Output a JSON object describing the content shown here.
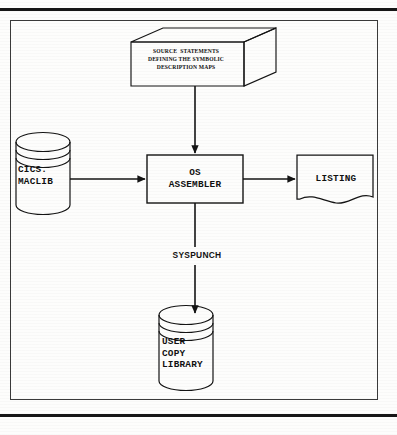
{
  "page": {
    "background_color": "#fdfdfc",
    "ink_color": "#111111",
    "rule_color": "#161616",
    "frame_color": "#3a3a3a"
  },
  "diagram": {
    "type": "flowchart",
    "orientation": "top-down-with-side-inputs-and-outputs",
    "nodes": [
      {
        "id": "source-statements",
        "shape": "cube-3d",
        "role": "input-deck",
        "text": "SOURCE  STATEMENTS\nDEFINING THE SYMBOLIC\nDESCRIPTION MAPS",
        "lines": [
          "SOURCE  STATEMENTS",
          "DEFINING THE SYMBOLIC",
          "DESCRIPTION MAPS"
        ]
      },
      {
        "id": "cics-maclib",
        "shape": "cylinder",
        "role": "input-library",
        "text": "CICS.\nMACLIB",
        "lines": [
          "CICS.",
          "MACLIB"
        ]
      },
      {
        "id": "os-assembler",
        "shape": "rectangle",
        "role": "process",
        "text": "OS\nASSEMBLER",
        "lines": [
          "OS",
          "ASSEMBLER"
        ]
      },
      {
        "id": "listing",
        "shape": "document",
        "role": "output-report",
        "text": "LISTING",
        "lines": [
          "LISTING"
        ]
      },
      {
        "id": "user-copy-library",
        "shape": "cylinder",
        "role": "output-library",
        "text": "USER\nCOPY\nLIBRARY",
        "lines": [
          "USER",
          "COPY",
          "LIBRARY"
        ]
      }
    ],
    "edges": [
      {
        "id": "edge-source-to-assembler",
        "from": "source-statements",
        "to": "os-assembler",
        "direction": "down",
        "arrowhead": "solid-triangle",
        "label": ""
      },
      {
        "id": "edge-maclib-to-assembler",
        "from": "cics-maclib",
        "to": "os-assembler",
        "direction": "right",
        "arrowhead": "solid-triangle",
        "label": ""
      },
      {
        "id": "edge-assembler-to-listing",
        "from": "os-assembler",
        "to": "listing",
        "direction": "right",
        "arrowhead": "solid-triangle",
        "label": ""
      },
      {
        "id": "edge-assembler-to-copylib",
        "from": "os-assembler",
        "to": "user-copy-library",
        "direction": "down",
        "arrowhead": "solid-triangle",
        "label": "SYSPUNCH"
      }
    ],
    "edge_labels": {
      "syspunch": "SYSPUNCH"
    }
  }
}
